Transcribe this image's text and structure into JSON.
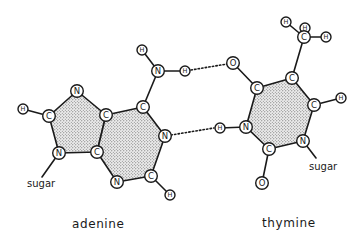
{
  "captions": {
    "left": "adenine",
    "right": "thymine"
  },
  "sugar_labels": {
    "adenine": "sugar",
    "thymine": "sugar"
  },
  "colors": {
    "ink": "#1a1a1a",
    "ring_fill": "#b8b8b8",
    "background": "#ffffff"
  },
  "adenine": {
    "atoms": [
      {
        "id": "H8",
        "el": "H",
        "x": 23,
        "y": 109
      },
      {
        "id": "C8",
        "el": "C",
        "x": 49,
        "y": 116
      },
      {
        "id": "N7",
        "el": "N",
        "x": 77,
        "y": 91
      },
      {
        "id": "C5",
        "el": "C",
        "x": 106,
        "y": 115
      },
      {
        "id": "N9",
        "el": "N",
        "x": 59,
        "y": 153
      },
      {
        "id": "C4",
        "el": "C",
        "x": 97,
        "y": 152
      },
      {
        "id": "C6",
        "el": "C",
        "x": 143,
        "y": 107
      },
      {
        "id": "N6",
        "el": "N",
        "x": 158,
        "y": 71
      },
      {
        "id": "H6a",
        "el": "H",
        "x": 142,
        "y": 50
      },
      {
        "id": "H6b",
        "el": "H",
        "x": 185,
        "y": 71
      },
      {
        "id": "N1",
        "el": "N",
        "x": 165,
        "y": 136
      },
      {
        "id": "C2",
        "el": "C",
        "x": 151,
        "y": 176
      },
      {
        "id": "N3",
        "el": "N",
        "x": 117,
        "y": 182
      },
      {
        "id": "H2",
        "el": "H",
        "x": 170,
        "y": 195
      }
    ]
  },
  "thymine": {
    "atoms": [
      {
        "id": "O4",
        "el": "O",
        "x": 233,
        "y": 63
      },
      {
        "id": "C4",
        "el": "C",
        "x": 257,
        "y": 88
      },
      {
        "id": "C5",
        "el": "C",
        "x": 292,
        "y": 78
      },
      {
        "id": "CM",
        "el": "C",
        "x": 304,
        "y": 37
      },
      {
        "id": "HMa",
        "el": "H",
        "x": 286,
        "y": 22
      },
      {
        "id": "HMb",
        "el": "H",
        "x": 305,
        "y": 27
      },
      {
        "id": "HMc",
        "el": "H",
        "x": 326,
        "y": 37
      },
      {
        "id": "C6",
        "el": "C",
        "x": 314,
        "y": 105
      },
      {
        "id": "H6",
        "el": "H",
        "x": 341,
        "y": 98
      },
      {
        "id": "N1",
        "el": "N",
        "x": 303,
        "y": 141
      },
      {
        "id": "C2",
        "el": "C",
        "x": 269,
        "y": 149
      },
      {
        "id": "O2",
        "el": "O",
        "x": 262,
        "y": 183
      },
      {
        "id": "N3",
        "el": "N",
        "x": 246,
        "y": 127
      },
      {
        "id": "H3",
        "el": "H",
        "x": 220,
        "y": 128
      }
    ]
  },
  "hydrogen_bonds": [
    {
      "from": "adenine.H6b",
      "to": "thymine.O4"
    },
    {
      "from": "adenine.N1",
      "to": "thymine.H3"
    }
  ]
}
